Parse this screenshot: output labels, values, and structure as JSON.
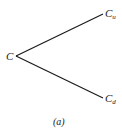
{
  "diagram": {
    "type": "binomial-tree-one-step",
    "nodes": {
      "root": {
        "label": "C",
        "subscript": ""
      },
      "up": {
        "label": "C",
        "subscript": "u"
      },
      "down": {
        "label": "C",
        "subscript": "d"
      }
    },
    "edges": [
      {
        "from": "root",
        "to": "up"
      },
      {
        "from": "root",
        "to": "down"
      }
    ],
    "caption": "(a)",
    "colors": {
      "line": "#1a1a1a",
      "text": "#1a1a1a",
      "background": "#ffffff"
    }
  }
}
